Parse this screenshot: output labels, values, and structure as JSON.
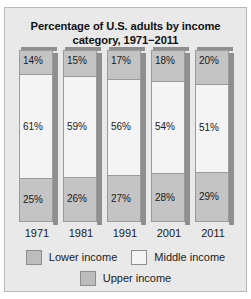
{
  "chart_data": {
    "type": "bar",
    "title": "Percentage of U.S. adults by income category, 1971−2011",
    "title_line1": "Percentage of U.S. adults by income",
    "title_line2": "category, 1971−2011",
    "xlabel": "",
    "ylabel": "",
    "ylim": [
      0,
      100
    ],
    "grid": false,
    "stacked": true,
    "legend_position": "bottom",
    "categories": [
      "1971",
      "1981",
      "1991",
      "2001",
      "2011"
    ],
    "series": [
      {
        "name": "Upper income",
        "values": [
          14,
          15,
          17,
          18,
          20
        ],
        "labels": [
          "14%",
          "15%",
          "17%",
          "18%",
          "20%"
        ],
        "color": "#c4c4c4"
      },
      {
        "name": "Middle income",
        "values": [
          61,
          59,
          56,
          54,
          51
        ],
        "labels": [
          "61%",
          "59%",
          "56%",
          "54%",
          "51%"
        ],
        "color": "#f4f4f4"
      },
      {
        "name": "Lower income",
        "values": [
          25,
          26,
          27,
          28,
          29
        ],
        "labels": [
          "25%",
          "26%",
          "27%",
          "28%",
          "29%"
        ],
        "color": "#c4c4c4"
      }
    ]
  },
  "legend": {
    "row1": [
      {
        "label": "Lower income",
        "swatch": "sw-lower"
      },
      {
        "label": "Middle income",
        "swatch": "sw-middle"
      }
    ],
    "row2": [
      {
        "label": "Upper income",
        "swatch": "sw-upper"
      }
    ]
  },
  "colors": {
    "panel_background": "#e9e9e9",
    "panel_border": "#b9b9b9",
    "bar_border": "#9a9a9a",
    "bar_shadow": "#8f8f8f",
    "upper_income": "#c4c4c4",
    "middle_income": "#f4f4f4",
    "lower_income": "#c4c4c4",
    "text": "#1a1a1a"
  }
}
